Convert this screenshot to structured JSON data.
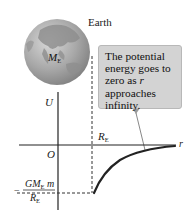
{
  "figure": {
    "earth_label": "Earth",
    "mass_label": {
      "symbol": "M",
      "subscript": "E"
    },
    "callout": {
      "line1": "The potential",
      "line2": "energy goes to",
      "line3_prefix": "zero as ",
      "line3_var": "r",
      "line4": "approaches",
      "line5": "infinity."
    },
    "axes": {
      "y_label": "U",
      "x_label": "r",
      "origin_label": "O",
      "radius_label": {
        "symbol": "R",
        "subscript": "E"
      }
    },
    "min_value_label": {
      "sign": "−",
      "numerator": {
        "G": "G",
        "M": "M",
        "subscript": "E",
        "m": "m"
      },
      "denominator": {
        "symbol": "R",
        "subscript": "E"
      }
    },
    "colors": {
      "callout_bg": "#d3d3d3",
      "curve": "#222222",
      "globe": "#9a9a9a"
    }
  }
}
